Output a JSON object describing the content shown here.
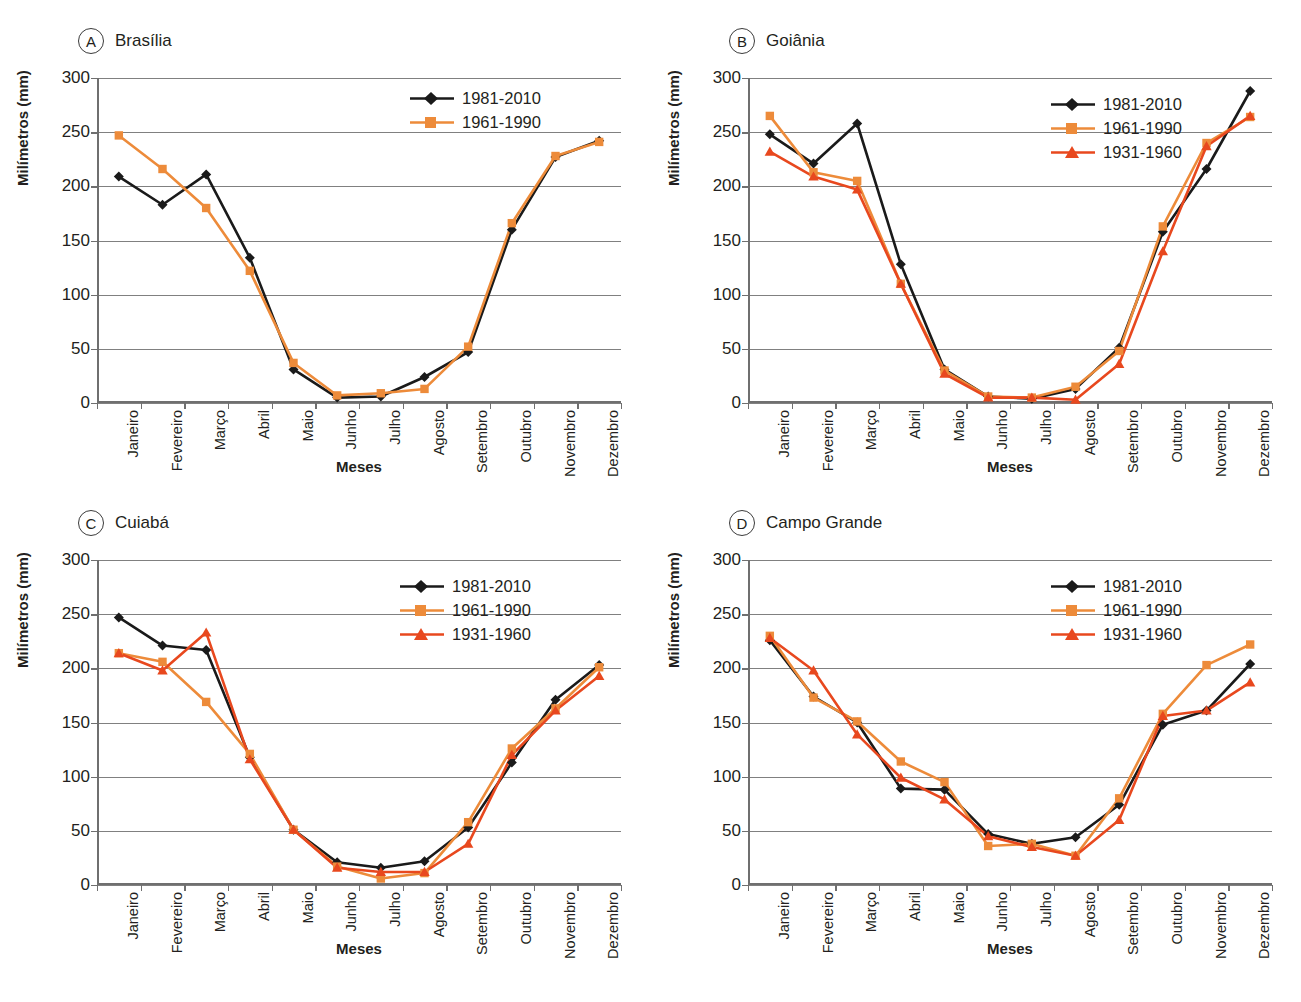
{
  "top_cropped_text": "",
  "axis": {
    "y_title": "Milímetros (mm)",
    "x_title": "Meses",
    "y_ticks": [
      "0",
      "50",
      "100",
      "150",
      "200",
      "250",
      "300"
    ],
    "y_min": 0,
    "y_max": 300,
    "months": [
      "Janeiro",
      "Fevereiro",
      "Março",
      "Abril",
      "Maio",
      "Junho",
      "Julho",
      "Agosto",
      "Setembro",
      "Outubro",
      "Novembro",
      "Dezembro"
    ]
  },
  "colors": {
    "series_1981_2010": "#1a1a1a",
    "series_1961_1990": "#ED8B3A",
    "series_1931_1960": "#E8481E",
    "gridline": "#808080",
    "axis": "#6f6f6f",
    "text": "#231f20"
  },
  "panels": [
    {
      "tag": "A",
      "title": "Brasília"
    },
    {
      "tag": "B",
      "title": "Goiânia"
    },
    {
      "tag": "C",
      "title": "Cuiabá"
    },
    {
      "tag": "D",
      "title": "Campo Grande"
    }
  ],
  "legend_labels": {
    "l1": "1981-2010",
    "l2": "1961-1990",
    "l3": "1931-1960"
  },
  "chart_data": [
    {
      "type": "line",
      "panel": "A",
      "title": "Brasília",
      "xlabel": "Meses",
      "ylabel": "Milímetros (mm)",
      "ylim": [
        0,
        300
      ],
      "grid": true,
      "legend_position": "top-right",
      "categories": [
        "Janeiro",
        "Fevereiro",
        "Março",
        "Abril",
        "Maio",
        "Junho",
        "Julho",
        "Agosto",
        "Setembro",
        "Outubro",
        "Novembro",
        "Dezembro"
      ],
      "series": [
        {
          "name": "1981-2010",
          "color": "#1a1a1a",
          "marker": "diamond",
          "values": [
            209,
            183,
            211,
            134,
            31,
            5,
            6,
            24,
            47,
            160,
            227,
            242
          ]
        },
        {
          "name": "1961-1990",
          "color": "#ED8B3A",
          "marker": "square",
          "values": [
            247,
            216,
            180,
            122,
            37,
            7,
            9,
            13,
            52,
            166,
            228,
            241
          ]
        }
      ]
    },
    {
      "type": "line",
      "panel": "B",
      "title": "Goiânia",
      "xlabel": "Meses",
      "ylabel": "Milímetros (mm)",
      "ylim": [
        0,
        300
      ],
      "grid": true,
      "legend_position": "top-right",
      "categories": [
        "Janeiro",
        "Fevereiro",
        "Março",
        "Abril",
        "Maio",
        "Junho",
        "Julho",
        "Agosto",
        "Setembro",
        "Outubro",
        "Novembro",
        "Dezembro"
      ],
      "series": [
        {
          "name": "1981-2010",
          "color": "#1a1a1a",
          "marker": "diamond",
          "values": [
            248,
            221,
            258,
            128,
            31,
            6,
            4,
            13,
            51,
            158,
            216,
            288
          ]
        },
        {
          "name": "1961-1990",
          "color": "#ED8B3A",
          "marker": "square",
          "values": [
            265,
            213,
            205,
            110,
            30,
            6,
            5,
            15,
            48,
            163,
            240,
            264
          ]
        },
        {
          "name": "1931-1960",
          "color": "#E8481E",
          "marker": "triangle",
          "values": [
            232,
            209,
            197,
            110,
            27,
            5,
            5,
            3,
            36,
            140,
            237,
            265
          ]
        }
      ]
    },
    {
      "type": "line",
      "panel": "C",
      "title": "Cuiabá",
      "xlabel": "Meses",
      "ylabel": "Milímetros (mm)",
      "ylim": [
        0,
        300
      ],
      "grid": true,
      "legend_position": "top-right",
      "categories": [
        "Janeiro",
        "Fevereiro",
        "Março",
        "Abril",
        "Maio",
        "Junho",
        "Julho",
        "Agosto",
        "Setembro",
        "Outubro",
        "Novembro",
        "Dezembro"
      ],
      "series": [
        {
          "name": "1981-2010",
          "color": "#1a1a1a",
          "marker": "diamond",
          "values": [
            247,
            221,
            217,
            118,
            51,
            21,
            16,
            22,
            53,
            113,
            171,
            203
          ]
        },
        {
          "name": "1961-1990",
          "color": "#ED8B3A",
          "marker": "square",
          "values": [
            214,
            206,
            169,
            121,
            51,
            17,
            6,
            11,
            58,
            126,
            163,
            201
          ]
        },
        {
          "name": "1931-1960",
          "color": "#E8481E",
          "marker": "triangle",
          "values": [
            214,
            198,
            233,
            116,
            51,
            16,
            12,
            12,
            38,
            120,
            161,
            193
          ]
        }
      ]
    },
    {
      "type": "line",
      "panel": "D",
      "title": "Campo Grande",
      "xlabel": "Meses",
      "ylabel": "Milímetros (mm)",
      "ylim": [
        0,
        300
      ],
      "grid": true,
      "legend_position": "top-right",
      "categories": [
        "Janeiro",
        "Fevereiro",
        "Março",
        "Abril",
        "Maio",
        "Junho",
        "Julho",
        "Agosto",
        "Setembro",
        "Outubro",
        "Novembro",
        "Dezembro"
      ],
      "series": [
        {
          "name": "1981-2010",
          "color": "#1a1a1a",
          "marker": "diamond",
          "values": [
            226,
            174,
            150,
            89,
            88,
            47,
            38,
            44,
            74,
            148,
            161,
            204
          ]
        },
        {
          "name": "1961-1990",
          "color": "#ED8B3A",
          "marker": "square",
          "values": [
            230,
            173,
            151,
            114,
            95,
            36,
            38,
            27,
            80,
            158,
            203,
            222
          ]
        },
        {
          "name": "1931-1960",
          "color": "#E8481E",
          "marker": "triangle",
          "values": [
            228,
            198,
            139,
            99,
            79,
            45,
            35,
            27,
            60,
            156,
            161,
            187
          ]
        }
      ]
    }
  ]
}
